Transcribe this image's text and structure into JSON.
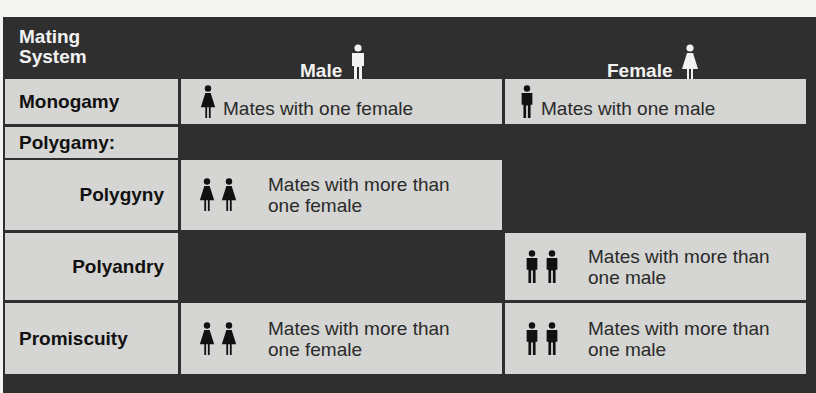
{
  "header": {
    "col_system": "Mating\nSystem",
    "col_system_line1": "Mating",
    "col_system_line2": "System",
    "col_male": "Male",
    "col_male_icon": "male-figure-icon",
    "col_female": "Female",
    "col_female_icon": "female-figure-icon"
  },
  "rows": [
    {
      "label": "Monogamy",
      "male": {
        "icons": [
          "female-figure-icon"
        ],
        "text": "Mates with one female"
      },
      "female": {
        "icons": [
          "male-figure-icon"
        ],
        "text": "Mates with one male"
      }
    },
    {
      "label": "Polygamy:",
      "male": null,
      "female": null
    },
    {
      "label": "Polygyny",
      "male": {
        "icons": [
          "female-figure-icon",
          "female-figure-icon"
        ],
        "text_line1": "Mates with more than",
        "text_line2": "one female"
      },
      "female": null
    },
    {
      "label": "Polyandry",
      "male": null,
      "female": {
        "icons": [
          "male-figure-icon",
          "male-figure-icon"
        ],
        "text_line1": "Mates with more than",
        "text_line2": "one male"
      }
    },
    {
      "label": "Promiscuity",
      "male": {
        "icons": [
          "female-figure-icon",
          "female-figure-icon"
        ],
        "text_line1": "Mates with more than",
        "text_line2": "one female"
      },
      "female": {
        "icons": [
          "male-figure-icon",
          "male-figure-icon"
        ],
        "text_line1": "Mates with more than",
        "text_line2": "one male"
      }
    }
  ],
  "colors": {
    "panel_dark": "#2f2f2f",
    "cell_light": "#d5d5d3",
    "header_text": "#f2f2f2",
    "body_text": "#2a2a2a",
    "label_text": "#111111"
  }
}
